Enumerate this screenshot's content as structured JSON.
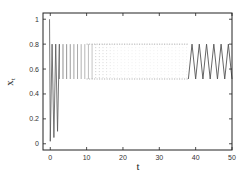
{
  "chart_data": {
    "type": "line",
    "title": "",
    "xlabel": "t",
    "ylabel": "x_t",
    "xlim": [
      -2,
      50
    ],
    "ylim": [
      -0.05,
      1.05
    ],
    "xticks": [
      0,
      10,
      20,
      30,
      40,
      50
    ],
    "xtick_labels": [
      "0",
      "10",
      "20",
      "30",
      "40",
      "50"
    ],
    "yticks": [
      0,
      0.2,
      0.4,
      0.6,
      0.8,
      1
    ],
    "ytick_labels": [
      "0",
      "0.2",
      "0.4",
      "0.6",
      "0.8",
      "1"
    ],
    "grid": false,
    "legend": null,
    "series": [
      {
        "name": "x_t",
        "description": "Initial transient from ~1 down to ~0, then period-2 oscillation between ~0.52 and ~0.80; dense dotted rendering from t≈0 to t≈38, solid zigzag from t≈38 to 50",
        "low": 0.52,
        "high": 0.8,
        "transient": [
          {
            "t": -0.2,
            "x": 1.0
          },
          {
            "t": 0.0,
            "x": 0.02
          },
          {
            "t": 0.5,
            "x": 0.8
          },
          {
            "t": 1.0,
            "x": 0.05
          },
          {
            "t": 1.5,
            "x": 0.8
          },
          {
            "t": 2.0,
            "x": 0.1
          },
          {
            "t": 2.5,
            "x": 0.8
          }
        ],
        "steady_start": 2.5,
        "solid_start": 38,
        "end": 50
      }
    ],
    "colors": {
      "line": "#555555",
      "frame": "#222222"
    }
  }
}
